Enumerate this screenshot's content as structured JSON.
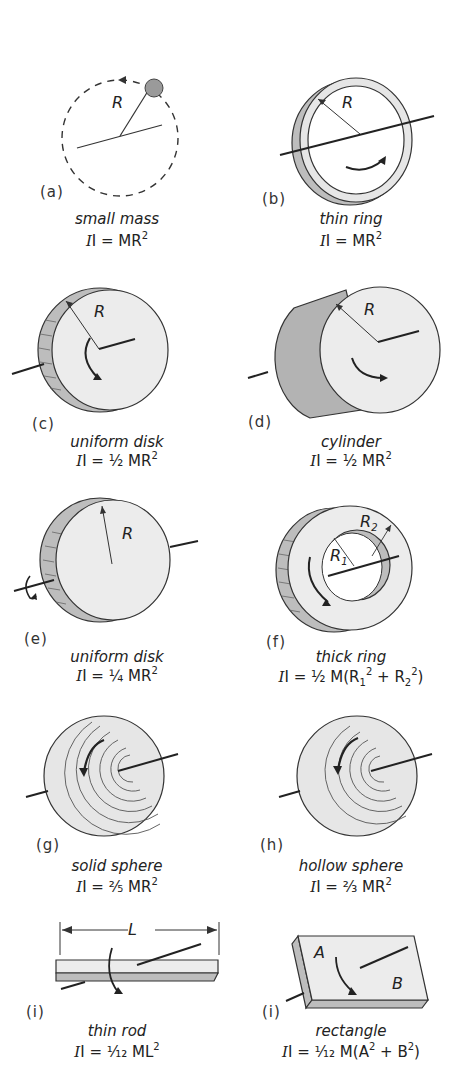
{
  "figure": {
    "panels": [
      {
        "id": "a",
        "tag": "(a)",
        "name": "small mass",
        "formula_prefix": "I = ",
        "formula_body": "MR",
        "formula_sup": "2",
        "labels": {
          "radius": "R"
        }
      },
      {
        "id": "b",
        "tag": "(b)",
        "name": "thin ring",
        "formula_prefix": "I = ",
        "formula_body": "MR",
        "formula_sup": "2",
        "labels": {
          "radius": "R"
        }
      },
      {
        "id": "c",
        "tag": "(c)",
        "name": "uniform disk",
        "formula_prefix": "I = ",
        "formula_coef": "½",
        "formula_body": " MR",
        "formula_sup": "2",
        "labels": {
          "radius": "R"
        }
      },
      {
        "id": "d",
        "tag": "(d)",
        "name": "cylinder",
        "formula_prefix": "I = ",
        "formula_coef": "½",
        "formula_body": " MR",
        "formula_sup": "2",
        "labels": {
          "radius": "R"
        }
      },
      {
        "id": "e",
        "tag": "(e)",
        "name": "uniform disk",
        "formula_prefix": "I = ",
        "formula_coef": "¼",
        "formula_body": " MR",
        "formula_sup": "2",
        "labels": {
          "radius": "R"
        }
      },
      {
        "id": "f",
        "tag": "(f)",
        "name": "thick ring",
        "formula_prefix": "I = ",
        "formula_coef": "½",
        "formula_body": " M(R",
        "formula_sub1": "1",
        "formula_sup1": "2",
        "formula_mid": " + R",
        "formula_sub2": "2",
        "formula_sup2": "2",
        "formula_end": ")",
        "labels": {
          "r1": "R",
          "r1_sub": "1",
          "r2": "R",
          "r2_sub": "2"
        }
      },
      {
        "id": "g",
        "tag": "(g)",
        "name": "solid sphere",
        "formula_prefix": "I = ",
        "formula_coef": "²⁄₅",
        "formula_body": " MR",
        "formula_sup": "2"
      },
      {
        "id": "h",
        "tag": "(h)",
        "name": "hollow sphere",
        "formula_prefix": "I = ",
        "formula_coef": "²⁄₃",
        "formula_body": " MR",
        "formula_sup": "2"
      },
      {
        "id": "i",
        "tag": "(i)",
        "name": "thin rod",
        "formula_prefix": "I = ",
        "formula_coef": "¹⁄₁₂",
        "formula_body": " ML",
        "formula_sup": "2",
        "labels": {
          "length": "L"
        }
      },
      {
        "id": "j",
        "tag": "(i)",
        "name": "rectangle",
        "formula_prefix": "I = ",
        "formula_coef": "¹⁄₁₂",
        "formula_body": " M(A",
        "formula_sup1": "2",
        "formula_mid": " + B",
        "formula_sup2": "2",
        "formula_end": ")",
        "labels": {
          "a": "A",
          "b": "B"
        }
      }
    ]
  },
  "colors": {
    "background": "#ffffff",
    "line": "#222222",
    "face": "#ececec",
    "shade": "#bdbdbd",
    "dark_shade": "#a8a8a8",
    "sphere": "#e6e6e6"
  }
}
